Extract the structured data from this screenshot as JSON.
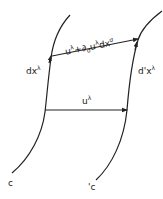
{
  "diagram": {
    "labels": {
      "top_vector": "uλ+∂σuλdxσ",
      "top_vector_parts": {
        "u": "u",
        "lambda1": "λ",
        "plus": "+",
        "partial": "∂",
        "sigma1": "σ",
        "u2": "u",
        "lambda2": "λ",
        "dx": "dx",
        "sigma2": "σ"
      },
      "left_tangent": "dxλ",
      "left_tangent_parts": {
        "base": "dx",
        "sup": "λ"
      },
      "right_tangent": "d'xλ",
      "right_tangent_parts": {
        "base": "d'x",
        "sup": "λ"
      },
      "bottom_vector": "uλ",
      "bottom_vector_parts": {
        "base": "u",
        "sup": "λ"
      },
      "left_curve": "c",
      "right_curve": "'c"
    },
    "colors": {
      "stroke": "#222222",
      "background": "#ffffff"
    }
  }
}
